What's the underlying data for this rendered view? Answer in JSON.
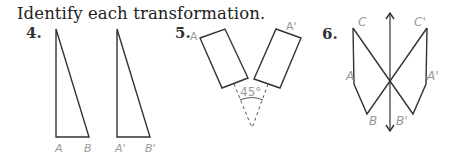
{
  "instruction": "Identify each transformation.",
  "problems": [
    {
      "number": "4.",
      "labels": {
        "a": "A",
        "b": "B",
        "a_prime": "A'",
        "b_prime": "B'"
      }
    },
    {
      "number": "5.",
      "labels": {
        "a": "A",
        "a_prime": "A'",
        "angle": "45°"
      }
    },
    {
      "number": "6.",
      "labels": {
        "c": "C",
        "c_prime": "C'",
        "a": "A",
        "a_prime": "A'",
        "b": "B",
        "b_prime": "B'"
      }
    }
  ],
  "colors": {
    "line": "#333333",
    "label": "#999999"
  }
}
